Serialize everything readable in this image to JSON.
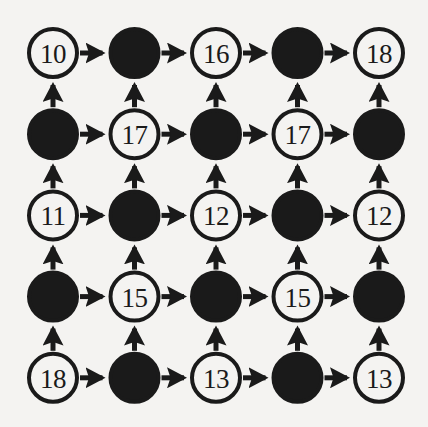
{
  "canvas": {
    "width": 428,
    "height": 427,
    "background_color": "#f4f3f1",
    "ink_color": "#1a1a1a"
  },
  "graph": {
    "type": "lattice-grid-digraph",
    "rows": 5,
    "cols": 5,
    "node_radius": 24,
    "node_stroke_width": 4,
    "origin_x": 53,
    "origin_y": 53,
    "spacing_x": 81.5,
    "spacing_y": 81.2,
    "edge_stroke_width": 5,
    "horizontal_edge_direction": "right",
    "vertical_edge_direction": "up",
    "open_node_fill": "#f4f3f1",
    "filled_node_fill": "#1a1a1a",
    "nodes": [
      [
        {
          "label": "10",
          "filled": false
        },
        {
          "label": "",
          "filled": true
        },
        {
          "label": "16",
          "filled": false
        },
        {
          "label": "",
          "filled": true
        },
        {
          "label": "18",
          "filled": false
        }
      ],
      [
        {
          "label": "",
          "filled": true
        },
        {
          "label": "17",
          "filled": false
        },
        {
          "label": "",
          "filled": true
        },
        {
          "label": "17",
          "filled": false
        },
        {
          "label": "",
          "filled": true
        }
      ],
      [
        {
          "label": "11",
          "filled": false
        },
        {
          "label": "",
          "filled": true
        },
        {
          "label": "12",
          "filled": false
        },
        {
          "label": "",
          "filled": true
        },
        {
          "label": "12",
          "filled": false
        }
      ],
      [
        {
          "label": "",
          "filled": true
        },
        {
          "label": "15",
          "filled": false
        },
        {
          "label": "",
          "filled": true
        },
        {
          "label": "15",
          "filled": false
        },
        {
          "label": "",
          "filled": true
        }
      ],
      [
        {
          "label": "18",
          "filled": false
        },
        {
          "label": "",
          "filled": true
        },
        {
          "label": "13",
          "filled": false
        },
        {
          "label": "",
          "filled": true
        },
        {
          "label": "13",
          "filled": false
        }
      ]
    ]
  }
}
